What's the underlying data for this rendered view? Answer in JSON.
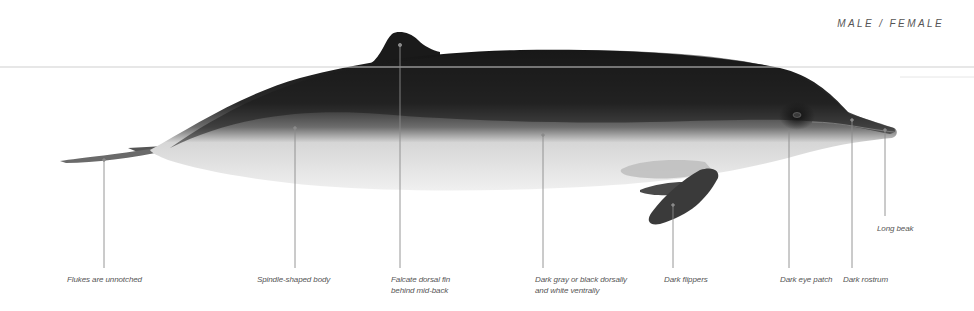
{
  "header": {
    "sex_label": "MALE / FEMALE"
  },
  "illustration": {
    "subject": "beaked whale, lateral view",
    "colors": {
      "dorsal": "#1c1c1c",
      "ventral": "#eeeeee",
      "flipper": "#3a3a3a",
      "leader_line": "#8a8a8a",
      "waterline": "#cfcfcf",
      "label_text": "#555555"
    }
  },
  "callouts": [
    {
      "id": "flukes",
      "lines": [
        "Flukes are unnotched"
      ]
    },
    {
      "id": "body",
      "lines": [
        "Spindle-shaped body"
      ]
    },
    {
      "id": "dorsal-fin",
      "lines": [
        "Falcate dorsal fin",
        "behind mid-back"
      ]
    },
    {
      "id": "coloration",
      "lines": [
        "Dark gray or black dorsally",
        "and white ventrally"
      ]
    },
    {
      "id": "flippers",
      "lines": [
        "Dark flippers"
      ]
    },
    {
      "id": "eye-patch",
      "lines": [
        "Dark eye patch"
      ]
    },
    {
      "id": "rostrum",
      "lines": [
        "Dark rostrum"
      ]
    },
    {
      "id": "beak",
      "lines": [
        "Long beak"
      ]
    }
  ]
}
